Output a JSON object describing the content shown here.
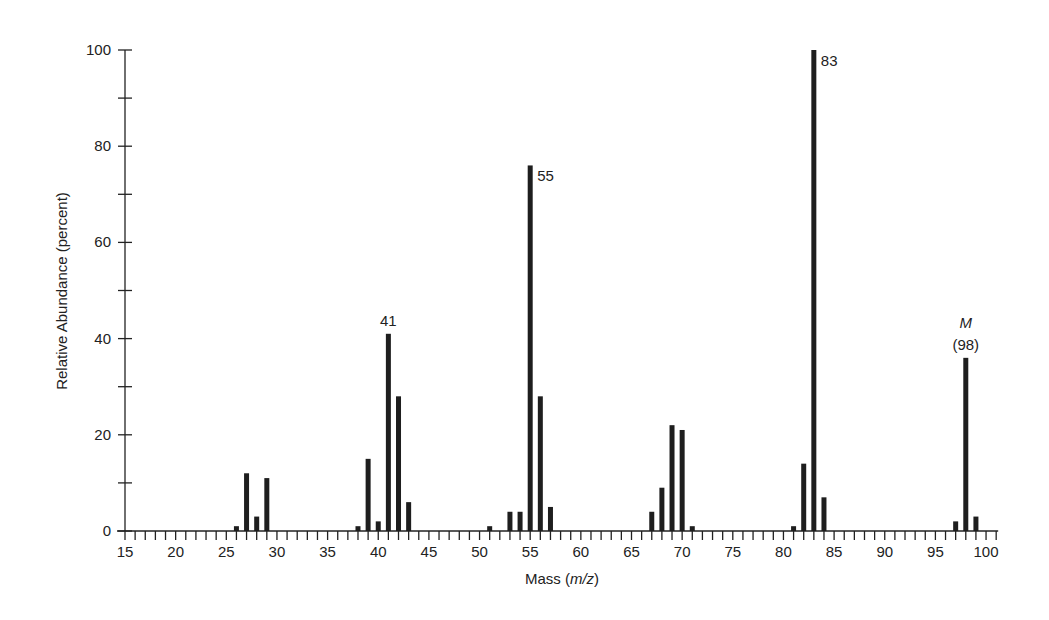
{
  "chart_data": {
    "type": "bar",
    "title": "",
    "xlabel": "Mass (m/z)",
    "xlabel_parts": {
      "prefix": "Mass (",
      "italic": "m/z",
      "suffix": ")"
    },
    "ylabel": "Relative Abundance (percent)",
    "xlim": [
      15,
      101
    ],
    "ylim": [
      0,
      100
    ],
    "x_ticks_major": [
      15,
      20,
      25,
      30,
      35,
      40,
      45,
      50,
      55,
      60,
      65,
      70,
      75,
      80,
      85,
      90,
      95,
      100
    ],
    "x_tick_minor_step": 1,
    "y_ticks_major": [
      0,
      20,
      40,
      60,
      80,
      100
    ],
    "y_tick_minor_step": 10,
    "grid": false,
    "legend": null,
    "x": [
      26,
      27,
      28,
      29,
      38,
      39,
      40,
      41,
      42,
      43,
      51,
      53,
      54,
      55,
      56,
      57,
      67,
      68,
      69,
      70,
      71,
      81,
      82,
      83,
      84,
      97,
      98,
      99
    ],
    "values": [
      1,
      12,
      3,
      11,
      1,
      15,
      2,
      41,
      28,
      6,
      1,
      4,
      4,
      76,
      28,
      5,
      4,
      9,
      22,
      21,
      1,
      1,
      14,
      100,
      7,
      2,
      36,
      3
    ],
    "annotations": [
      {
        "x": 41,
        "text": "41",
        "position": "above"
      },
      {
        "x": 55,
        "text": "55",
        "position": "right-top"
      },
      {
        "x": 83,
        "text": "83",
        "position": "right-top"
      },
      {
        "x": 98,
        "text": "(98)",
        "position": "above",
        "prefix_italic": "M"
      }
    ]
  }
}
